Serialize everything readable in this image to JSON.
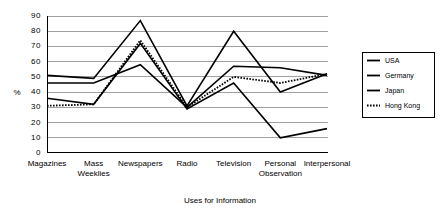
{
  "chart_data": {
    "type": "line",
    "title": "",
    "xlabel": "Uses for Information",
    "ylabel": "%",
    "ylim": [
      0,
      90
    ],
    "yticks": [
      "0",
      "10",
      "20",
      "30",
      "40",
      "50",
      "60",
      "70",
      "80",
      "90"
    ],
    "grid": true,
    "legend_position": "right",
    "categories": [
      "Magazines",
      "Mass Weeklies",
      "Newspapers",
      "Radio",
      "Television",
      "Personal Observation",
      "Interpersonal"
    ],
    "category_lines": [
      [
        "Magazines"
      ],
      [
        "Mass",
        "Weeklies"
      ],
      [
        "Newspapers"
      ],
      [
        "Radio"
      ],
      [
        "Television"
      ],
      [
        "Personal",
        "Observation"
      ],
      [
        "Interpersonal"
      ]
    ],
    "series": [
      {
        "name": "USA",
        "style": "solid",
        "color": "#000000",
        "width": 1.6,
        "values": [
          51,
          49,
          87,
          31,
          80,
          40,
          52
        ]
      },
      {
        "name": "Germany",
        "style": "solid",
        "color": "#000000",
        "width": 1.6,
        "values": [
          46,
          46,
          58,
          30,
          57,
          56,
          51
        ]
      },
      {
        "name": "Japan",
        "style": "solid",
        "color": "#000000",
        "width": 1.6,
        "values": [
          36,
          32,
          72,
          29,
          46,
          10,
          16
        ]
      },
      {
        "name": "Hong Kong",
        "style": "dotted",
        "color": "#000000",
        "width": 1.8,
        "values": [
          31,
          32,
          74,
          30,
          50,
          46,
          52
        ]
      }
    ]
  },
  "legend": {
    "items": [
      {
        "label": "USA",
        "style": "solid"
      },
      {
        "label": "Germany",
        "style": "solid"
      },
      {
        "label": "Japan",
        "style": "solid"
      },
      {
        "label": "Hong Kong",
        "style": "dotted"
      }
    ]
  }
}
